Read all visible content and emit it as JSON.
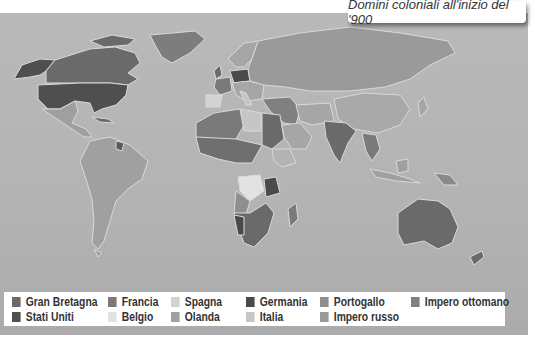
{
  "title": "Domini coloniali all'inizio del '900",
  "map": {
    "colors": {
      "ocean": "#b5b5b5",
      "border": "#d9d9d9",
      "gran_bretagna": "#6a6a6a",
      "francia": "#7a7a7a",
      "spagna": "#d2d2d2",
      "germania": "#4a4a4a",
      "portogallo": "#8f8f8f",
      "impero_ottomano": "#808080",
      "stati_uniti": "#4f4f4f",
      "belgio": "#e2e2e2",
      "olanda": "#a0a0a0",
      "italia": "#c6c6c6",
      "impero_russo": "#9a9a9a",
      "independent": "#a6a6a6"
    }
  },
  "legend": {
    "items": [
      {
        "label": "Gran Bretagna",
        "color": "#6a6a6a"
      },
      {
        "label": "Francia",
        "color": "#7a7a7a"
      },
      {
        "label": "Spagna",
        "color": "#d2d2d2"
      },
      {
        "label": "Germania",
        "color": "#4a4a4a"
      },
      {
        "label": "Portogallo",
        "color": "#8f8f8f"
      },
      {
        "label": "Impero ottomano",
        "color": "#808080"
      },
      {
        "label": "Stati Uniti",
        "color": "#4f4f4f"
      },
      {
        "label": "Belgio",
        "color": "#e2e2e2"
      },
      {
        "label": "Olanda",
        "color": "#a0a0a0"
      },
      {
        "label": "Italia",
        "color": "#c6c6c6"
      },
      {
        "label": "Impero russo",
        "color": "#9a9a9a"
      }
    ]
  }
}
